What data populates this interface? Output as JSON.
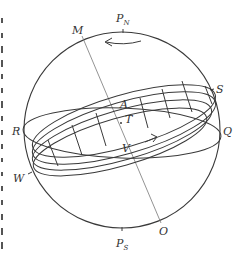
{
  "figure": {
    "type": "celestial-sphere-diagram",
    "labels": {
      "north_pole": {
        "main": "P",
        "sub": "N"
      },
      "south_pole": {
        "main": "P",
        "sub": "S"
      },
      "M": "M",
      "O": "O",
      "S": "S",
      "Q": "Q",
      "R": "R",
      "W": "W",
      "A": "A",
      "T": "T",
      "V": "V"
    },
    "annotations": {
      "rotation_arrow": "arrow pointing left near north pole indicating rotation",
      "motion_arrow": "arrow along band pointing right near T"
    },
    "colors": {
      "stroke": "#3a3a3a",
      "axis_line": "#777777",
      "background": "#ffffff"
    }
  }
}
